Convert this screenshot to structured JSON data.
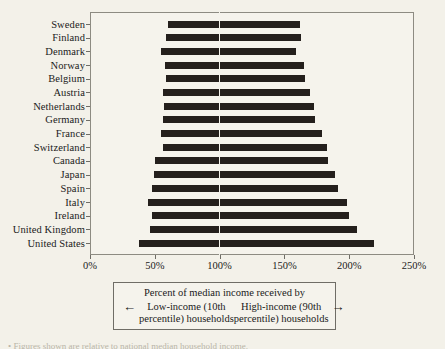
{
  "chart_data": {
    "type": "bar",
    "orientation": "horizontal-range",
    "title": "",
    "xlabel": "Percent of median income received by",
    "ylabel": "",
    "xlim": [
      0,
      250
    ],
    "xtick_labels": [
      "0%",
      "50%",
      "100%",
      "150%",
      "200%",
      "250%"
    ],
    "xticks": [
      0,
      50,
      100,
      150,
      200,
      250
    ],
    "grid": false,
    "reference_line": 100,
    "categories": [
      "Sweden",
      "Finland",
      "Denmark",
      "Norway",
      "Belgium",
      "Austria",
      "Netherlands",
      "Germany",
      "France",
      "Switzerland",
      "Canada",
      "Japan",
      "Spain",
      "Italy",
      "Ireland",
      "United Kingdom",
      "United States"
    ],
    "series": [
      {
        "name": "Low-income (10th percentile) households",
        "values": [
          60,
          59,
          55,
          58,
          59,
          56,
          57,
          56,
          55,
          56,
          50,
          49,
          48,
          45,
          48,
          46,
          38
        ]
      },
      {
        "name": "High-income (90th percentile) households",
        "values": [
          162,
          163,
          159,
          165,
          166,
          170,
          173,
          174,
          179,
          183,
          184,
          189,
          191,
          198,
          200,
          206,
          219
        ]
      }
    ],
    "bars": [
      {
        "category": "Sweden",
        "low": 60,
        "high": 162
      },
      {
        "category": "Finland",
        "low": 59,
        "high": 163
      },
      {
        "category": "Denmark",
        "low": 55,
        "high": 159
      },
      {
        "category": "Norway",
        "low": 58,
        "high": 165
      },
      {
        "category": "Belgium",
        "low": 59,
        "high": 166
      },
      {
        "category": "Austria",
        "low": 56,
        "high": 170
      },
      {
        "category": "Netherlands",
        "low": 57,
        "high": 173
      },
      {
        "category": "Germany",
        "low": 56,
        "high": 174
      },
      {
        "category": "France",
        "low": 55,
        "high": 179
      },
      {
        "category": "Switzerland",
        "low": 56,
        "high": 183
      },
      {
        "category": "Canada",
        "low": 50,
        "high": 184
      },
      {
        "category": "Japan",
        "low": 49,
        "high": 189
      },
      {
        "category": "Spain",
        "low": 48,
        "high": 191
      },
      {
        "category": "Italy",
        "low": 45,
        "high": 198
      },
      {
        "category": "Ireland",
        "low": 48,
        "high": 200
      },
      {
        "category": "United Kingdom",
        "low": 46,
        "high": 206
      },
      {
        "category": "United States",
        "low": 38,
        "high": 219
      }
    ],
    "colors": {
      "bar": "#241f1c",
      "background": "#f5f3ec",
      "axis": "#6f6d66",
      "reference_line": "#f5f3ec"
    }
  },
  "legend": {
    "title": "Percent of median income received by",
    "left": {
      "arrow": "←",
      "line1": "Low-income (10th",
      "line2": "percentile) households"
    },
    "right": {
      "arrow": "→",
      "line1": "High-income (90th",
      "line2": "percentile) households"
    }
  },
  "footnote": {
    "text": "• Figures shown are relative to national median household income."
  }
}
